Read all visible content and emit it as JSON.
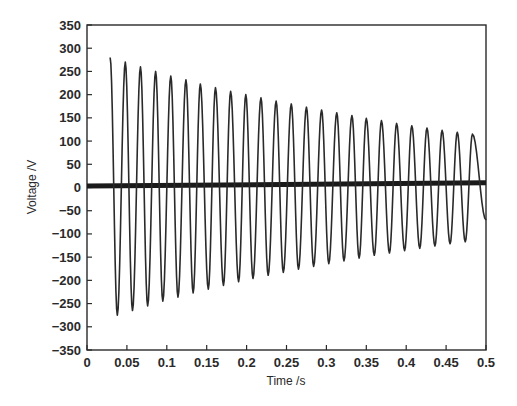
{
  "chart_data": {
    "type": "line",
    "title": "",
    "xlabel": "Time /s",
    "ylabel": "Voltage /V",
    "xlim": [
      0,
      0.5
    ],
    "ylim": [
      -350,
      350
    ],
    "grid": false,
    "legend": null,
    "x_ticks": [
      "0",
      "0.05",
      "0.1",
      "0.15",
      "0.2",
      "0.25",
      "0.3",
      "0.35",
      "0.4",
      "0.45",
      "0.5"
    ],
    "y_ticks": [
      "350",
      "300",
      "250",
      "200",
      "150",
      "100",
      "50",
      "0",
      "-50",
      "-100",
      "-150",
      "-200",
      "-250",
      "-300",
      "-350"
    ],
    "series": [
      {
        "name": "decaying oscillation",
        "description": "Damped sinusoid starting at t≈0.029 s with peak ≈280 V, period ≈0.019 s, decaying to ≈115 V peak near t=0.49 s",
        "start_time": 0.029,
        "end_time": 0.5,
        "period": 0.0189,
        "peaks": [
          {
            "t": 0.029,
            "v": 280
          },
          {
            "t": 0.048,
            "v": 270
          },
          {
            "t": 0.067,
            "v": 260
          },
          {
            "t": 0.086,
            "v": 250
          },
          {
            "t": 0.105,
            "v": 240
          },
          {
            "t": 0.124,
            "v": 232
          },
          {
            "t": 0.142,
            "v": 223
          },
          {
            "t": 0.161,
            "v": 215
          },
          {
            "t": 0.18,
            "v": 207
          },
          {
            "t": 0.199,
            "v": 200
          },
          {
            "t": 0.218,
            "v": 193
          },
          {
            "t": 0.237,
            "v": 186
          },
          {
            "t": 0.256,
            "v": 180
          },
          {
            "t": 0.275,
            "v": 173
          },
          {
            "t": 0.294,
            "v": 167
          },
          {
            "t": 0.313,
            "v": 161
          },
          {
            "t": 0.332,
            "v": 155
          },
          {
            "t": 0.35,
            "v": 149
          },
          {
            "t": 0.369,
            "v": 144
          },
          {
            "t": 0.388,
            "v": 138
          },
          {
            "t": 0.407,
            "v": 133
          },
          {
            "t": 0.426,
            "v": 128
          },
          {
            "t": 0.445,
            "v": 123
          },
          {
            "t": 0.464,
            "v": 119
          },
          {
            "t": 0.483,
            "v": 115
          }
        ],
        "troughs": [
          {
            "t": 0.038,
            "v": -275
          },
          {
            "t": 0.057,
            "v": -265
          },
          {
            "t": 0.076,
            "v": -255
          },
          {
            "t": 0.095,
            "v": -245
          },
          {
            "t": 0.114,
            "v": -236
          },
          {
            "t": 0.133,
            "v": -227
          },
          {
            "t": 0.152,
            "v": -219
          },
          {
            "t": 0.171,
            "v": -211
          },
          {
            "t": 0.19,
            "v": -203
          },
          {
            "t": 0.208,
            "v": -196
          },
          {
            "t": 0.227,
            "v": -189
          },
          {
            "t": 0.246,
            "v": -183
          },
          {
            "t": 0.265,
            "v": -176
          },
          {
            "t": 0.284,
            "v": -170
          },
          {
            "t": 0.303,
            "v": -164
          },
          {
            "t": 0.322,
            "v": -158
          },
          {
            "t": 0.341,
            "v": -152
          },
          {
            "t": 0.36,
            "v": -146
          },
          {
            "t": 0.379,
            "v": -141
          },
          {
            "t": 0.398,
            "v": -136
          },
          {
            "t": 0.417,
            "v": -131
          },
          {
            "t": 0.436,
            "v": -126
          },
          {
            "t": 0.455,
            "v": -121
          },
          {
            "t": 0.474,
            "v": -117
          }
        ],
        "end_value": -70,
        "color": "#2a2a2a"
      },
      {
        "name": "baseline",
        "description": "Thick near-zero trace across the full time range, rising slightly from ≈3 V to ≈10 V",
        "x": [
          0,
          0.5
        ],
        "values": [
          3,
          10
        ],
        "color": "#1a1a1a"
      }
    ]
  }
}
